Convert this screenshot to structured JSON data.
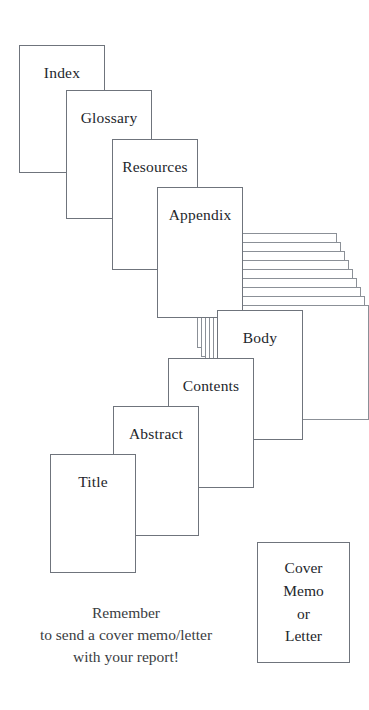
{
  "diagram": {
    "background_color": "#ffffff",
    "outline_color": "#6f747c",
    "sheet_outline_color": "#8b9097",
    "text_color": "#23262b",
    "cards": [
      {
        "label": "Index",
        "x": 19,
        "y": 45,
        "w": 86,
        "h": 128
      },
      {
        "label": "Glossary",
        "x": 66,
        "y": 90,
        "w": 86,
        "h": 129
      },
      {
        "label": "Resources",
        "x": 112,
        "y": 139,
        "w": 86,
        "h": 131
      },
      {
        "label": "Appendix",
        "x": 157,
        "y": 187,
        "w": 86,
        "h": 131
      },
      {
        "label": "Body",
        "x": 217,
        "y": 310,
        "w": 86,
        "h": 130
      },
      {
        "label": "Contents",
        "x": 168,
        "y": 358,
        "w": 86,
        "h": 130
      },
      {
        "label": "Abstract",
        "x": 113,
        "y": 406,
        "w": 86,
        "h": 130
      },
      {
        "label": "Title",
        "x": 50,
        "y": 454,
        "w": 86,
        "h": 119
      }
    ],
    "body_stack": {
      "count": 9,
      "x": 197,
      "y": 233,
      "w": 140,
      "h": 115,
      "step_x": 4,
      "step_y": 9
    },
    "cover_memo": {
      "x": 257,
      "y": 542,
      "w": 93,
      "h": 121,
      "lines": [
        "Cover",
        "Memo",
        "or",
        "Letter"
      ]
    },
    "reminder": {
      "x": 0,
      "y": 602,
      "w": 252,
      "lines": [
        "Remember",
        "to send a cover memo/letter",
        "with your report!"
      ]
    }
  }
}
